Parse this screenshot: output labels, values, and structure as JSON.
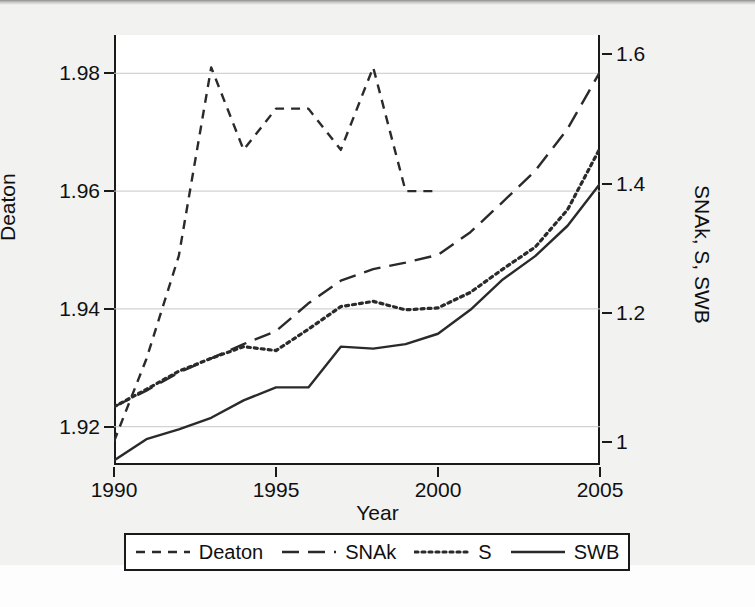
{
  "figure": {
    "background_color": "#f2f2f0",
    "plot_background_color": "#ffffff",
    "line_color": "#2a2a2a",
    "grid_color": "#c8c8c8",
    "axis_color": "#1a1a1a"
  },
  "axes": {
    "xlabel": "Year",
    "ylabel_left": "Deaton",
    "ylabel_right": "SNAk, S, SWB",
    "x_ticks": [
      "1990",
      "1995",
      "2000",
      "2005"
    ],
    "y_ticks_left": [
      "1.98",
      "1.96",
      "1.94",
      "1.92"
    ],
    "y_ticks_right": [
      "1.6",
      "1.4",
      "1.2",
      "1"
    ]
  },
  "legend": {
    "entries": [
      {
        "label": "Deaton",
        "dash": "dashed-short"
      },
      {
        "label": "SNAk",
        "dash": "dashed-long"
      },
      {
        "label": "S",
        "dash": "dotted"
      },
      {
        "label": "SWB",
        "dash": "solid"
      }
    ]
  },
  "chart_data": {
    "type": "line",
    "title": "",
    "xlabel": "Year",
    "ylabel": "Deaton",
    "ylabel_secondary": "SNAk, S, SWB",
    "grid": true,
    "legend_position": "below",
    "xlim": [
      1990,
      2005
    ],
    "xticks": [
      1990,
      1995,
      2000,
      2005
    ],
    "ylim_left": [
      1.9135,
      1.9865
    ],
    "yticks_left": [
      1.92,
      1.94,
      1.96,
      1.98
    ],
    "ylim_right": [
      0.965,
      1.63
    ],
    "yticks_right": [
      1.0,
      1.2,
      1.4,
      1.6
    ],
    "x": [
      1990,
      1991,
      1992,
      1993,
      1994,
      1995,
      1996,
      1997,
      1998,
      1999,
      2000,
      2001,
      2002,
      2003,
      2004,
      2005
    ],
    "series": [
      {
        "name": "Deaton",
        "axis": "left",
        "dash": "dashed-short",
        "x": [
          1990,
          1991,
          1992,
          1993,
          1994,
          1995,
          1996,
          1997,
          1998,
          1999,
          2000
        ],
        "values": [
          1.9175,
          1.9315,
          1.949,
          1.981,
          1.967,
          1.974,
          1.974,
          1.967,
          1.981,
          1.96,
          1.96
        ]
      },
      {
        "name": "SNAk",
        "axis": "right",
        "dash": "dashed-long",
        "x": [
          1990,
          1991,
          1992,
          1993,
          1994,
          1995,
          1996,
          1997,
          1998,
          1999,
          2000,
          2001,
          2002,
          2003,
          2004,
          2005
        ],
        "values": [
          1.055,
          1.08,
          1.108,
          1.13,
          1.152,
          1.172,
          1.215,
          1.25,
          1.268,
          1.278,
          1.29,
          1.325,
          1.372,
          1.42,
          1.485,
          1.573
        ]
      },
      {
        "name": "S",
        "axis": "right",
        "dash": "dotted",
        "x": [
          1990,
          1991,
          1992,
          1993,
          1994,
          1995,
          1996,
          1997,
          1998,
          1999,
          2000,
          2001,
          2002,
          2003,
          2004,
          2005
        ],
        "values": [
          1.055,
          1.082,
          1.11,
          1.13,
          1.148,
          1.142,
          1.175,
          1.21,
          1.218,
          1.205,
          1.208,
          1.232,
          1.268,
          1.302,
          1.36,
          1.455
        ]
      },
      {
        "name": "SWB",
        "axis": "right",
        "dash": "solid",
        "x": [
          1990,
          1991,
          1992,
          1993,
          1994,
          1995,
          1996,
          1997,
          1998,
          1999,
          2000,
          2001,
          2002,
          2003,
          2004,
          2005
        ],
        "values": [
          0.972,
          1.005,
          1.02,
          1.038,
          1.065,
          1.085,
          1.085,
          1.148,
          1.145,
          1.152,
          1.168,
          1.205,
          1.252,
          1.288,
          1.335,
          1.4
        ]
      }
    ]
  }
}
